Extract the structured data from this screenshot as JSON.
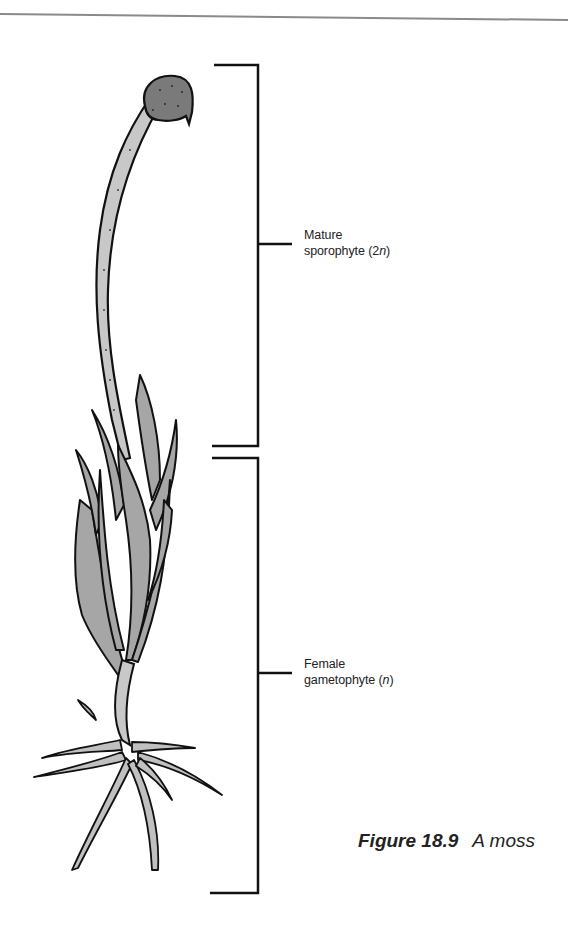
{
  "figure": {
    "number": "Figure 18.9",
    "title": "A moss"
  },
  "labels": {
    "sporophyte": {
      "line1": "Mature",
      "line2_prefix": "sporophyte (2",
      "line2_italic": "n",
      "line2_suffix": ")"
    },
    "gametophyte": {
      "line1": "Female",
      "line2_prefix": "gametophyte (",
      "line2_italic": "n",
      "line2_suffix": ")"
    }
  },
  "colors": {
    "outline": "#111111",
    "leaf_fill": "#a6a6a6",
    "stalk_fill": "#c8c8c8",
    "capsule_fill": "#7a7a7a",
    "rule": "#888888"
  }
}
